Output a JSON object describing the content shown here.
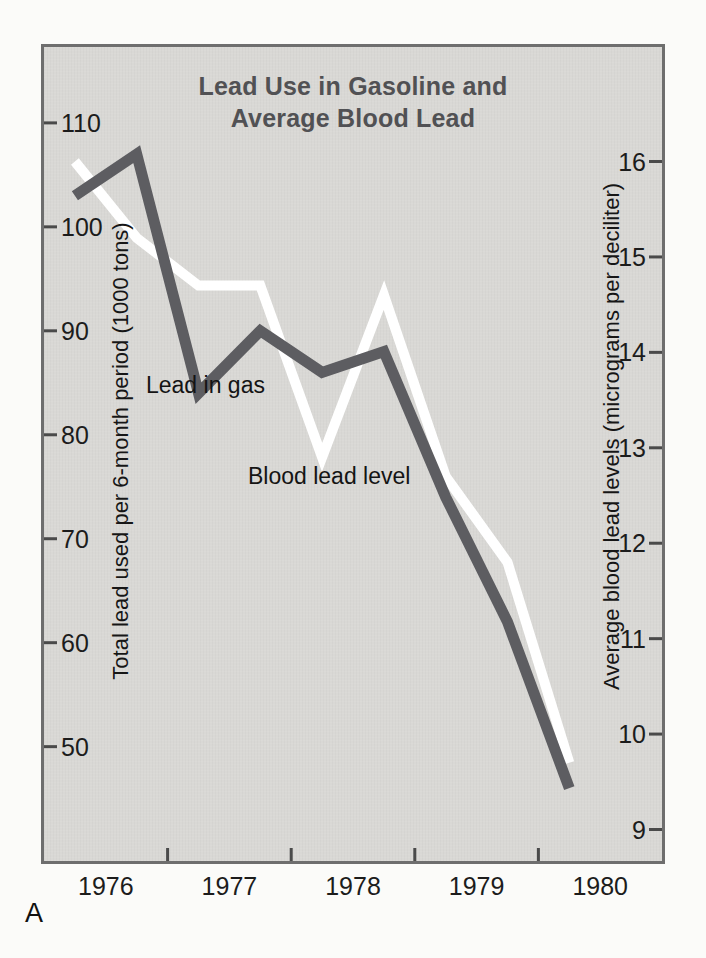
{
  "figure": {
    "panel_label": "A",
    "title_line1": "Lead Use in Gasoline and",
    "title_line2": "Average Blood Lead"
  },
  "chart_data": {
    "type": "line",
    "title": "Lead Use in Gasoline and Average Blood Lead",
    "x_half_year_points": [
      1976.25,
      1976.75,
      1977.25,
      1977.75,
      1978.25,
      1978.75,
      1979.25,
      1979.75,
      1980.25
    ],
    "x_axis": {
      "range": [
        1976,
        1981
      ],
      "tick_values": [
        1977,
        1978,
        1979,
        1980
      ],
      "year_labels": [
        "1976",
        "1977",
        "1978",
        "1979",
        "1980"
      ],
      "year_label_centers": [
        1976.5,
        1977.5,
        1978.5,
        1979.5,
        1980.5
      ]
    },
    "left_axis": {
      "label": "Total lead used per 6-month period (1000 tons)",
      "ticks": [
        110,
        100,
        90,
        80,
        70,
        60,
        50
      ],
      "range": [
        39,
        117.3
      ]
    },
    "right_axis": {
      "label": "Average blood lead levels (micrograms per deciliter)",
      "ticks": [
        16,
        15,
        14,
        13,
        12,
        11,
        10,
        9
      ],
      "range": [
        8.67,
        17.2
      ]
    },
    "series": [
      {
        "name": "Blood lead level",
        "axis": "right",
        "color": "#ffffff",
        "stroke_width": 10,
        "values": [
          16.0,
          15.2,
          14.7,
          14.7,
          12.9,
          14.6,
          12.7,
          11.8,
          9.7
        ]
      },
      {
        "name": "Lead in gas",
        "axis": "left",
        "color": "#5d5d61",
        "stroke_width": 11,
        "values": [
          103,
          107,
          84,
          90,
          86,
          88,
          74,
          62,
          46
        ]
      }
    ],
    "annotations": [
      {
        "text": "Lead in gas",
        "series": "Lead in gas"
      },
      {
        "text": "Blood lead level",
        "series": "Blood lead level"
      }
    ],
    "grid": "off",
    "legend_position": "inline-annotations"
  },
  "colors": {
    "page_bg": "#fbfbf9",
    "plot_bg": "#d9d8d5",
    "plot_border": "#6e6e6e",
    "title_text": "#515154",
    "axis_text": "#1c1c1c",
    "gas_line": "#5d5d61",
    "blood_line": "#ffffff",
    "tick_mark": "#4a4a4a"
  }
}
